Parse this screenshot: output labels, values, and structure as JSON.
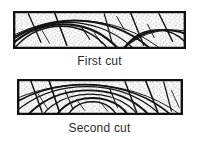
{
  "figure": {
    "background_color": "#ffffff",
    "ink_color": "#111111",
    "speckle_color": "#3a3a3a",
    "caption_color": "#2b2b2b"
  },
  "panels": [
    {
      "id": "first-cut",
      "caption": "First cut",
      "border_color": "#111111",
      "fill_color": "#fbfbfb",
      "description": "Flat sawn board cross-section with shallow arching annual growth rings",
      "grain_arcs": [
        {
          "cx": 50,
          "cy": 78,
          "rx": 62,
          "ry": 62
        },
        {
          "cx": 52,
          "cy": 84,
          "rx": 74,
          "ry": 70
        },
        {
          "cx": 58,
          "cy": 96,
          "rx": 92,
          "ry": 84
        },
        {
          "cx": 64,
          "cy": 112,
          "rx": 112,
          "ry": 102
        },
        {
          "cx": 150,
          "cy": 70,
          "rx": 44,
          "ry": 50
        },
        {
          "cx": 158,
          "cy": 84,
          "rx": 60,
          "ry": 64
        }
      ],
      "rays": [
        {
          "x1": 16,
          "y1": 4,
          "x2": 30,
          "y2": 34
        },
        {
          "x1": 44,
          "y1": 2,
          "x2": 56,
          "y2": 36
        },
        {
          "x1": 96,
          "y1": 4,
          "x2": 104,
          "y2": 34
        },
        {
          "x1": 122,
          "y1": 2,
          "x2": 136,
          "y2": 36
        },
        {
          "x1": 152,
          "y1": 4,
          "x2": 166,
          "y2": 32
        }
      ]
    },
    {
      "id": "second-cut",
      "caption": "Second cut",
      "border_color": "#111111",
      "fill_color": "#fbfbfb",
      "description": "Deeper board cross-section with tighter, more strongly curved annual growth rings",
      "grain_arcs": [
        {
          "cx": 78,
          "cy": 44,
          "rx": 26,
          "ry": 20
        },
        {
          "cx": 78,
          "cy": 50,
          "rx": 40,
          "ry": 30
        },
        {
          "cx": 76,
          "cy": 58,
          "rx": 56,
          "ry": 42
        },
        {
          "cx": 74,
          "cy": 68,
          "rx": 74,
          "ry": 56
        },
        {
          "cx": 72,
          "cy": 80,
          "rx": 94,
          "ry": 72
        },
        {
          "cx": 70,
          "cy": 94,
          "rx": 116,
          "ry": 88
        }
      ],
      "rays": [
        {
          "x1": 14,
          "y1": 2,
          "x2": 26,
          "y2": 34
        },
        {
          "x1": 34,
          "y1": 2,
          "x2": 44,
          "y2": 34
        },
        {
          "x1": 112,
          "y1": 4,
          "x2": 124,
          "y2": 34
        },
        {
          "x1": 134,
          "y1": 2,
          "x2": 146,
          "y2": 34
        },
        {
          "x1": 152,
          "y1": 4,
          "x2": 160,
          "y2": 34
        }
      ]
    }
  ]
}
